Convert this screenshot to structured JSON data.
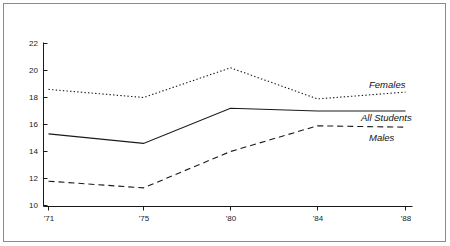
{
  "chart_data": {
    "type": "line",
    "title": "",
    "subtitle": "",
    "xlabel": "",
    "ylabel": "",
    "x": [
      "'71",
      "'75",
      "'80",
      "'84",
      "'88"
    ],
    "x_numeric": [
      71,
      75,
      80,
      84,
      88
    ],
    "xlim": [
      71,
      88
    ],
    "ylim": [
      10,
      22
    ],
    "yticks": [
      10,
      12,
      14,
      16,
      18,
      20,
      22
    ],
    "ytick_labels": [
      "10",
      "12",
      "14",
      "16",
      "18",
      "20",
      "22"
    ],
    "xtick_labels": [
      "'71",
      "'75",
      "'80",
      "'84",
      "'88"
    ],
    "grid": false,
    "legend_position": "inline-right",
    "series": [
      {
        "name": "Females",
        "style": "dotted",
        "color": "#1a1a1a",
        "values": [
          18.6,
          18.0,
          20.2,
          17.9,
          18.4
        ]
      },
      {
        "name": "All Students",
        "style": "solid",
        "color": "#1a1a1a",
        "values": [
          15.3,
          14.6,
          17.2,
          17.0,
          17.0
        ]
      },
      {
        "name": "Males",
        "style": "dashed",
        "color": "#1a1a1a",
        "values": [
          11.8,
          11.3,
          14.0,
          15.9,
          15.8
        ]
      }
    ],
    "annotations": [
      {
        "text": "Females",
        "series": "Females"
      },
      {
        "text": "All Students",
        "series": "All Students"
      },
      {
        "text": "Males",
        "series": "Males"
      }
    ]
  },
  "axis": {
    "y_ticks": [
      "22",
      "20",
      "18",
      "16",
      "14",
      "12",
      "10"
    ],
    "x_ticks": [
      "'71",
      "'75",
      "'80",
      "'84",
      "'88"
    ]
  },
  "labels": {
    "females": "Females",
    "all_students": "All Students",
    "males": "Males"
  },
  "colors": {
    "frame": "#8a8a8a",
    "axis": "#1a1a1a",
    "ink": "#1a1a1a"
  }
}
